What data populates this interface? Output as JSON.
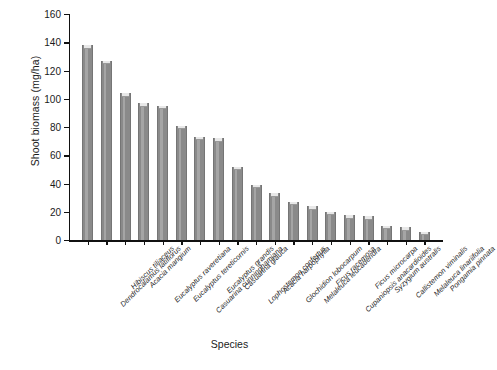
{
  "chart_data": {
    "type": "bar",
    "title": "",
    "xlabel": "Species",
    "ylabel": "Shoot biomass (mg/ha)",
    "ylim": [
      0,
      160
    ],
    "yticks": [
      0,
      20,
      40,
      60,
      80,
      100,
      120,
      140,
      160
    ],
    "grid": false,
    "legend": null,
    "bar_color": "#8a8a8a",
    "categories": [
      "Dendrocalamus latiflorus",
      "Hibiscus tiliaceus",
      "Acacia mangium",
      "Eucalyptus raveretiana",
      "Eucalyptus tereticornis",
      "Casuarina cunninghamiana",
      "Eucalyptus grandis",
      "Casuarina glauca",
      "Lophostemon confertus",
      "Acacia harpophylla",
      "Glochidion lobocarpum",
      "Melaleuca leucadendra",
      "Ficus racemosa",
      "Cupaniopsis anacardioides",
      "Ficus microcarpa",
      "Syzygium australis",
      "Callistemon viminalis",
      "Melaleuca linariifolia",
      "Pongamia pinnata"
    ],
    "values": [
      138,
      127,
      104,
      97,
      95,
      81,
      73,
      72,
      52,
      39,
      33,
      27,
      24,
      20,
      17.5,
      17,
      10,
      9,
      6
    ]
  }
}
